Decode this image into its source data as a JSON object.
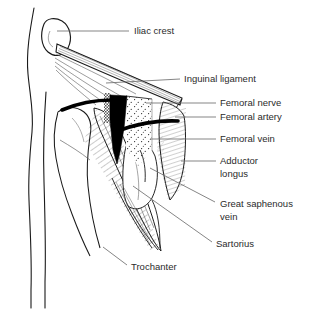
{
  "figure": {
    "background_color": "#ffffff",
    "line_color": "#1a1a1a",
    "leader_line_color": "#6f6f6f",
    "text_color": "#2b2b2b",
    "fill_black": "#000000",
    "fill_white": "#ffffff",
    "width": 316,
    "height": 313
  },
  "labels": [
    {
      "id": "iliac-crest",
      "text": "Iliac crest",
      "lines": [
        "Iliac crest"
      ],
      "text_x": 134,
      "text_y": 31,
      "leader": {
        "x1": 57,
        "y1": 31,
        "x2": 129,
        "y2": 31
      }
    },
    {
      "id": "inguinal-ligament",
      "text": "Inguinal ligament",
      "lines": [
        "Inguinal ligament"
      ],
      "text_x": 184,
      "text_y": 79,
      "leader": {
        "x1": 106,
        "y1": 83,
        "x2": 180,
        "y2": 79
      }
    },
    {
      "id": "femoral-nerve",
      "text": "Femoral nerve",
      "lines": [
        "Femoral nerve"
      ],
      "text_x": 220,
      "text_y": 103,
      "leader": {
        "x1": 146,
        "y1": 103,
        "x2": 216,
        "y2": 103
      }
    },
    {
      "id": "femoral-artery",
      "text": "Femoral artery",
      "lines": [
        "Femoral artery"
      ],
      "text_x": 220,
      "text_y": 117,
      "leader": {
        "x1": 175,
        "y1": 117,
        "x2": 216,
        "y2": 117
      }
    },
    {
      "id": "femoral-vein",
      "text": "Femoral vein",
      "lines": [
        "Femoral vein"
      ],
      "text_x": 220,
      "text_y": 139,
      "leader": {
        "x1": 150,
        "y1": 139,
        "x2": 216,
        "y2": 139
      }
    },
    {
      "id": "adductor-longus",
      "text": "Adductor longus",
      "lines": [
        "Adductor",
        "longus"
      ],
      "text_x": 220,
      "text_y": 161,
      "leader": {
        "x1": 181,
        "y1": 161,
        "x2": 216,
        "y2": 161
      }
    },
    {
      "id": "great-saphenous-vein",
      "text": "Great saphenous vein",
      "lines": [
        "Great saphenous",
        "vein"
      ],
      "text_x": 220,
      "text_y": 204,
      "leader": {
        "x1": 150,
        "y1": 168,
        "x2": 215,
        "y2": 202
      }
    },
    {
      "id": "sartorius",
      "text": "Sartorius",
      "lines": [
        "Sartorius"
      ],
      "text_x": 216,
      "text_y": 244,
      "leader": {
        "x1": 133,
        "y1": 186,
        "x2": 212,
        "y2": 242
      }
    },
    {
      "id": "trochanter",
      "text": "Trochanter",
      "lines": [
        "Trochanter"
      ],
      "text_x": 131,
      "text_y": 267,
      "leader": {
        "x1": 103,
        "y1": 247,
        "x2": 127,
        "y2": 265
      }
    }
  ],
  "structures": [
    {
      "id": "body-outline",
      "name": "Torso and thigh skin outline"
    },
    {
      "id": "iliac-crest-bone",
      "name": "Iliac crest bony prominence"
    },
    {
      "id": "inguinal-ligament-band",
      "name": "Inguinal ligament fibrous band"
    },
    {
      "id": "femoral-nerve-cord",
      "name": "Femoral nerve (thick black cord)"
    },
    {
      "id": "femoral-artery-cord",
      "name": "Femoral artery (thick black cord)"
    },
    {
      "id": "femoral-vein-wedge",
      "name": "Femoral vein (solid black tapering wedge)"
    },
    {
      "id": "femoral-sheath-stipple",
      "name": "Stippled femoral sheath region"
    },
    {
      "id": "adductor-longus-muscle",
      "name": "Adductor longus muscle (hatched)"
    },
    {
      "id": "sartorius-muscle",
      "name": "Sartorius muscle (long hatched strap)"
    },
    {
      "id": "greater-trochanter",
      "name": "Greater trochanter of femur"
    },
    {
      "id": "great-saphenous-vein-line",
      "name": "Great saphenous vein"
    }
  ]
}
